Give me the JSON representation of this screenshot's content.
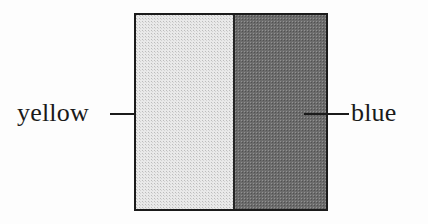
{
  "figure": {
    "type": "color-comparison-swatch",
    "background_color": "#fdfdfd",
    "square": {
      "border_color": "#1b1b1b",
      "divider_color": "#242424",
      "halves": [
        {
          "id": "left",
          "label": "yellow",
          "rendered_color": "#e9e9e9",
          "appearance": "very light gray halftone"
        },
        {
          "id": "right",
          "label": "blue",
          "rendered_color": "#6c6c6c",
          "appearance": "medium dark gray halftone"
        }
      ]
    },
    "labels": {
      "left": "yellow",
      "right": "blue"
    },
    "leader_lines": {
      "color": "#1b1b1b",
      "left_present": true,
      "right_present": true
    }
  }
}
